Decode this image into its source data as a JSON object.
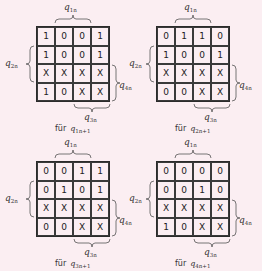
{
  "figure": {
    "background": "#fbeef2",
    "maps": [
      {
        "id": "q1",
        "cells": [
          [
            "1",
            "0",
            "0",
            "1"
          ],
          [
            "1",
            "0",
            "0",
            "1"
          ],
          [
            "X",
            "X",
            "X",
            "X"
          ],
          [
            "1",
            "0",
            "X",
            "X"
          ]
        ],
        "top_label": {
          "base": "q",
          "sub": "1n"
        },
        "left_label": {
          "base": "q",
          "sub": "2n"
        },
        "right_label": {
          "base": "q",
          "sub": "4n"
        },
        "bottom_label": {
          "base": "q",
          "sub": "3n"
        },
        "caption": {
          "prefix": "für",
          "base": "q",
          "sub": "1n+1"
        }
      },
      {
        "id": "q2",
        "cells": [
          [
            "0",
            "1",
            "1",
            "0"
          ],
          [
            "1",
            "0",
            "0",
            "1"
          ],
          [
            "X",
            "X",
            "X",
            "X"
          ],
          [
            "0",
            "0",
            "X",
            "X"
          ]
        ],
        "top_label": {
          "base": "q",
          "sub": "1n"
        },
        "left_label": {
          "base": "q",
          "sub": "2n"
        },
        "right_label": {
          "base": "q",
          "sub": "4n"
        },
        "bottom_label": {
          "base": "q",
          "sub": "3n"
        },
        "caption": {
          "prefix": "für",
          "base": "q",
          "sub": "2n+1"
        }
      },
      {
        "id": "q3",
        "cells": [
          [
            "0",
            "0",
            "1",
            "1"
          ],
          [
            "0",
            "1",
            "0",
            "1"
          ],
          [
            "X",
            "X",
            "X",
            "X"
          ],
          [
            "0",
            "0",
            "X",
            "X"
          ]
        ],
        "top_label": {
          "base": "q",
          "sub": "1n"
        },
        "left_label": {
          "base": "q",
          "sub": "2n"
        },
        "right_label": {
          "base": "q",
          "sub": "4n"
        },
        "bottom_label": {
          "base": "q",
          "sub": "3n"
        },
        "caption": {
          "prefix": "für",
          "base": "q",
          "sub": "3n+1"
        }
      },
      {
        "id": "q4",
        "cells": [
          [
            "0",
            "0",
            "0",
            "0"
          ],
          [
            "0",
            "0",
            "1",
            "0"
          ],
          [
            "X",
            "X",
            "X",
            "X"
          ],
          [
            "1",
            "0",
            "X",
            "X"
          ]
        ],
        "top_label": {
          "base": "q",
          "sub": "1n"
        },
        "left_label": {
          "base": "q",
          "sub": "2n"
        },
        "right_label": {
          "base": "q",
          "sub": "4n"
        },
        "bottom_label": {
          "base": "q",
          "sub": "3n"
        },
        "caption": {
          "prefix": "für",
          "base": "q",
          "sub": "4n+1"
        }
      }
    ]
  }
}
